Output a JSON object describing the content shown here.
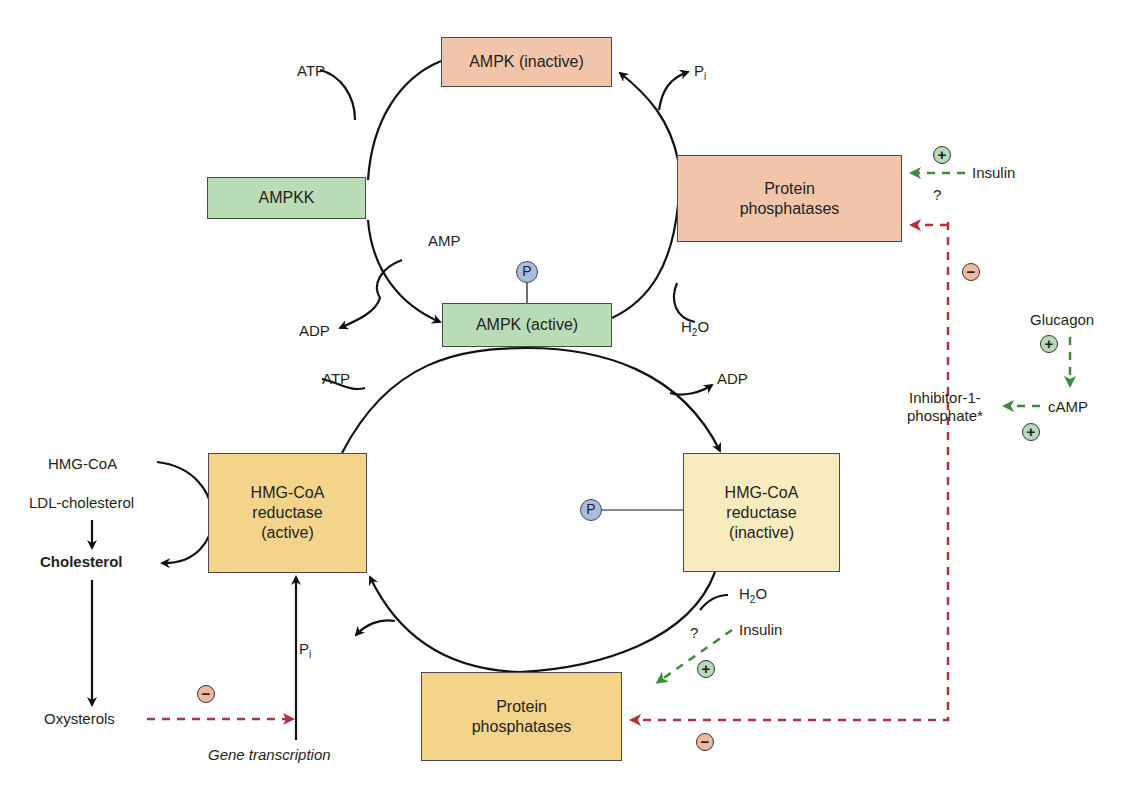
{
  "colors": {
    "inactive_kinase": "#f2c5ab",
    "active_kinase": "#b9dcb6",
    "reductase_active": "#f3d48a",
    "reductase_inactive": "#f8ebbd",
    "stimulation": "#3d8a3d",
    "inhibition": "#b0323a",
    "phosphate": "#a9bde0"
  },
  "boxes": {
    "ampk_inactive": "AMPK (inactive)",
    "ampkk": "AMPKK",
    "protein_phosphatases_top": "Protein phosphatases",
    "ampk_active": "AMPK (active)",
    "hmgcoa_reductase_active": "HMG-CoA reductase (active)",
    "hmgcoa_reductase_inactive": "HMG-CoA reductase (inactive)",
    "protein_phosphatases_bottom": "Protein phosphatases"
  },
  "labels": {
    "atp_top": "ATP",
    "pi_top": "P",
    "pi_sub": "i",
    "amp": "AMP",
    "adp_top": "ADP",
    "h2o_top_h": "H",
    "h2o_sub": "2",
    "h2o_o": "O",
    "atp_mid": "ATP",
    "adp_mid": "ADP",
    "hmgcoa": "HMG-CoA",
    "ldl": "LDL-cholesterol",
    "cholesterol": "Cholesterol",
    "oxysterols": "Oxysterols",
    "gene_transcription": "Gene transcription",
    "pi_bottom": "P",
    "h2o_bottom_h": "H",
    "insulin_top": "Insulin",
    "insulin_bottom": "Insulin",
    "question_top": "?",
    "question_bottom": "?",
    "glucagon": "Glucagon",
    "camp": "cAMP",
    "inhibitor_line1": "Inhibitor-1-",
    "inhibitor_line2": "phosphate*",
    "phospho": "P",
    "plus": "+",
    "minus": "−"
  }
}
